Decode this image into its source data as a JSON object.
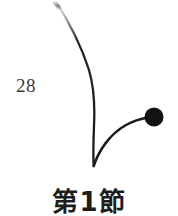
{
  "page": {
    "background_color": "#ffffff",
    "width": 178,
    "height": 216
  },
  "folio": {
    "name": "page-number",
    "number": "28",
    "color": "#3b3a38"
  },
  "ornament": {
    "name": "curved-flourish-ornament",
    "description": "tapered curved rule ending in a filled dot",
    "stroke_color": "#1a1a1a",
    "dot_color": "#121212",
    "stroke_width": 2.2,
    "dot_radius": 9.5,
    "dot_center_x": 154,
    "dot_center_y": 117
  },
  "heading": {
    "name": "section-heading",
    "text": "第1節",
    "color": "#1d1d1d"
  }
}
